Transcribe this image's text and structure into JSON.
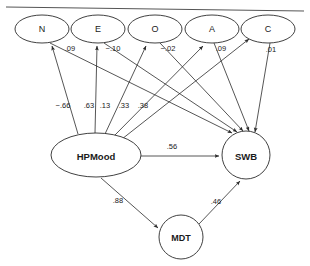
{
  "figure": {
    "type": "path-diagram",
    "background": "#ffffff",
    "line_color": "#2b2b2b",
    "rule_color": "#555555",
    "width": 310,
    "height": 266
  },
  "nodes": {
    "traits": [
      {
        "id": "N",
        "label": "N",
        "shape": "ellipse",
        "cx": 42,
        "cy": 29,
        "rx": 27,
        "ry": 14
      },
      {
        "id": "E",
        "label": "E",
        "shape": "ellipse",
        "cx": 98,
        "cy": 29,
        "rx": 27,
        "ry": 14
      },
      {
        "id": "O",
        "label": "O",
        "shape": "ellipse",
        "cx": 155,
        "cy": 29,
        "rx": 27,
        "ry": 14
      },
      {
        "id": "A",
        "label": "A",
        "shape": "ellipse",
        "cx": 212,
        "cy": 29,
        "rx": 27,
        "ry": 14
      },
      {
        "id": "C",
        "label": "C",
        "shape": "ellipse",
        "cx": 268,
        "cy": 29,
        "rx": 27,
        "ry": 14
      }
    ],
    "hpmood": {
      "id": "HPMood",
      "label": "HPMood",
      "shape": "ellipse",
      "cx": 96,
      "cy": 155,
      "rx": 45,
      "ry": 22
    },
    "swb": {
      "id": "SWB",
      "label": "SWB",
      "shape": "circle",
      "cx": 246,
      "cy": 155,
      "r": 24
    },
    "mdt": {
      "id": "MDT",
      "label": "MDT",
      "shape": "circle",
      "cx": 181,
      "cy": 237,
      "r": 22
    }
  },
  "paths": [
    {
      "id": "hpmood-to-n",
      "from": "HPMood",
      "to": "N",
      "coefficient": "−.66",
      "label_x": 63,
      "label_y": 105
    },
    {
      "id": "hpmood-to-e",
      "from": "HPMood",
      "to": "E",
      "coefficient": ".63",
      "label_x": 89,
      "label_y": 105
    },
    {
      "id": "hpmood-to-o",
      "from": "HPMood",
      "to": "O",
      "coefficient": ".13",
      "label_x": 105,
      "label_y": 105
    },
    {
      "id": "hpmood-to-a",
      "from": "HPMood",
      "to": "A",
      "coefficient": ".33",
      "label_x": 124,
      "label_y": 105
    },
    {
      "id": "hpmood-to-c",
      "from": "HPMood",
      "to": "C",
      "coefficient": ".38",
      "label_x": 143,
      "label_y": 105
    },
    {
      "id": "n-to-swb",
      "from": "N",
      "to": "SWB",
      "coefficient": ".09",
      "label_x": 70,
      "label_y": 48
    },
    {
      "id": "e-to-swb",
      "from": "E",
      "to": "SWB",
      "coefficient": "−.10",
      "label_x": 113,
      "label_y": 48
    },
    {
      "id": "o-to-swb",
      "from": "O",
      "to": "SWB",
      "coefficient": "−.02",
      "label_x": 168,
      "label_y": 48
    },
    {
      "id": "a-to-swb",
      "from": "A",
      "to": "SWB",
      "coefficient": ".09",
      "label_x": 221,
      "label_y": 48
    },
    {
      "id": "c-to-swb",
      "from": "C",
      "to": "SWB",
      "coefficient": ".01",
      "label_x": 271,
      "label_y": 49
    },
    {
      "id": "hpmood-to-swb",
      "from": "HPMood",
      "to": "SWB",
      "coefficient": ".56",
      "label_x": 172,
      "label_y": 146
    },
    {
      "id": "hpmood-to-mdt",
      "from": "HPMood",
      "to": "MDT",
      "coefficient": ".88",
      "label_x": 118,
      "label_y": 200
    },
    {
      "id": "mdt-to-swb",
      "from": "MDT",
      "to": "SWB",
      "coefficient": ".46",
      "label_x": 216,
      "label_y": 201
    }
  ]
}
